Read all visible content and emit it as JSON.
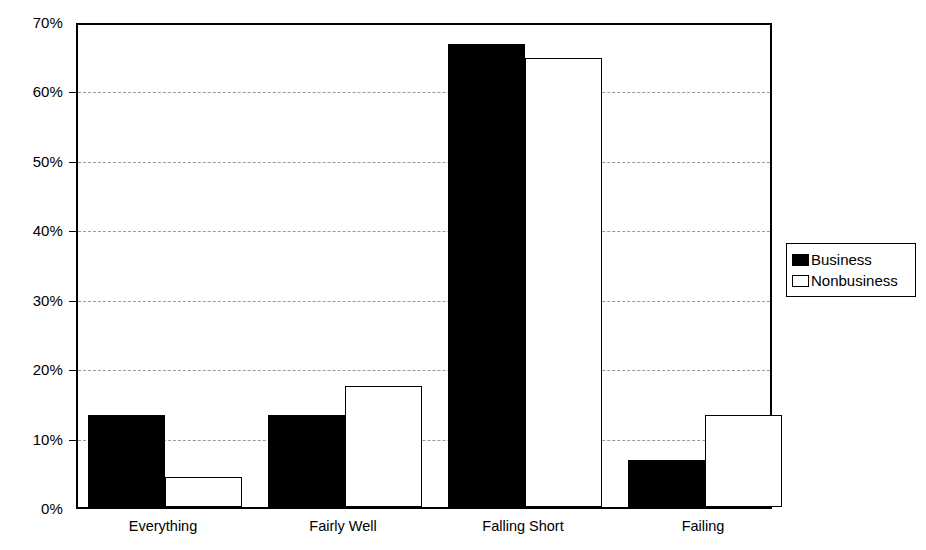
{
  "chart_data": {
    "type": "bar",
    "title": "",
    "subtitle": "",
    "xlabel": "",
    "ylabel": "",
    "categories": [
      "Everything",
      "Fairly Well",
      "Falling Short",
      "Failing"
    ],
    "series": [
      {
        "name": "Business",
        "color": "#000000",
        "fill": "solid-black",
        "values": [
          13.2,
          13.2,
          66.7,
          6.7
        ]
      },
      {
        "name": "Nonbusiness",
        "color": "#ffffff",
        "fill": "white-outline",
        "values": [
          4.3,
          17.5,
          64.7,
          13.2
        ]
      }
    ],
    "ylim": [
      0,
      70
    ],
    "y_ticks": [
      0,
      10,
      20,
      30,
      40,
      50,
      60,
      70
    ],
    "y_tick_labels": [
      "0%",
      "10%",
      "20%",
      "30%",
      "40%",
      "50%",
      "60%",
      "70%"
    ],
    "y_tick_suffix": "%",
    "grid": {
      "horizontal": true,
      "vertical": false,
      "style": "dashed",
      "color": "#9a9a9a"
    },
    "legend": {
      "position": "right",
      "entries": [
        {
          "label": "Business",
          "swatch": "solid-black"
        },
        {
          "label": "Nonbusiness",
          "swatch": "white-outline"
        }
      ]
    },
    "axis": {
      "line_color": "#000000",
      "frame": true
    },
    "background": "#ffffff"
  },
  "geometry": {
    "plot_left": 76,
    "plot_top": 23,
    "plot_width": 696,
    "plot_height": 486,
    "px_per_percent": 6.943,
    "group_starts": [
      88,
      268,
      448,
      628
    ],
    "bar_width": 77,
    "label_centers": [
      163,
      343,
      523,
      703
    ]
  }
}
